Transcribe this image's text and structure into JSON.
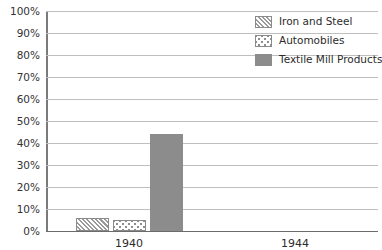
{
  "chart_data": {
    "type": "bar",
    "title": "",
    "xlabel": "",
    "ylabel": "",
    "categories": [
      "1940",
      "1944"
    ],
    "series": [
      {
        "name": "Iron and Steel",
        "values": [
          6,
          0
        ],
        "pattern": "diagonal-hatch"
      },
      {
        "name": "Automobiles",
        "values": [
          5,
          0
        ],
        "pattern": "dotted"
      },
      {
        "name": "Textile Mill Products",
        "values": [
          44,
          0
        ],
        "pattern": "solid"
      }
    ],
    "ylim": [
      0,
      100
    ],
    "ytick_labels": [
      "100%",
      "90%",
      "80%",
      "70%",
      "60%",
      "50%",
      "40%",
      "30%",
      "20%",
      "10%",
      "0%"
    ],
    "ytick_values": [
      100,
      90,
      80,
      70,
      60,
      50,
      40,
      30,
      20,
      10,
      0
    ],
    "grid": true,
    "legend_position": "top-right"
  },
  "colors": {
    "bar_solid": "#8c8c8c",
    "pattern_stroke": "#9a9a9a",
    "bar_border": "#8a8a8a",
    "gridline": "#bfbfbf",
    "axis": "#7a7a7a",
    "baseline": "#6b6b6b",
    "text": "#2b2b2b",
    "tick_text": "#333333",
    "background": "#ffffff"
  }
}
